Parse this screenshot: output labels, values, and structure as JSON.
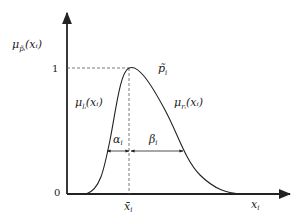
{
  "diagram": {
    "type": "membership-function",
    "y_axis_label": {
      "base": "μ",
      "sub": "p̃ᵢ",
      "arg": "(xᵢ)"
    },
    "x_axis_label": {
      "base": "x",
      "sub": "i"
    },
    "y_tick_one": "1",
    "origin_label": "0",
    "peak_label": {
      "base": "p̃",
      "sub": "i"
    },
    "center_label": {
      "base": "x̄",
      "sub": "i"
    },
    "left_branch_label": {
      "base": "μ",
      "sub": "lᵢ",
      "arg": "(xᵢ)"
    },
    "right_branch_label": {
      "base": "μ",
      "sub": "rᵢ",
      "arg": "(xᵢ)"
    },
    "alpha_label": {
      "base": "α",
      "sub": "i"
    },
    "beta_label": {
      "base": "β",
      "sub": "i"
    },
    "colors": {
      "line": "#222222",
      "dashed": "#555555",
      "background": "#ffffff"
    }
  }
}
